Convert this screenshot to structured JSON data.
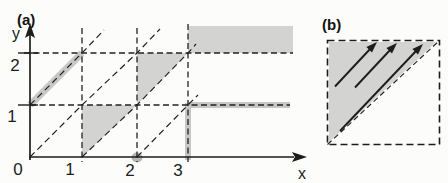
{
  "figure": {
    "type": "math-diagram"
  },
  "colors": {
    "paper": "#fcfcfb",
    "ink": "#1d1d1d",
    "shade": "#d3d3d2",
    "band": "#c7c7c6",
    "blob": "#b6b6b4"
  },
  "panel_a": {
    "label": "(a)",
    "y_axis_label": "y",
    "x_axis_label": "x",
    "origin_label": "0",
    "x_tick_labels": [
      "1",
      "2",
      "3"
    ],
    "y_tick_labels": [
      "1",
      "2"
    ]
  },
  "panel_b": {
    "label": "(b)"
  }
}
